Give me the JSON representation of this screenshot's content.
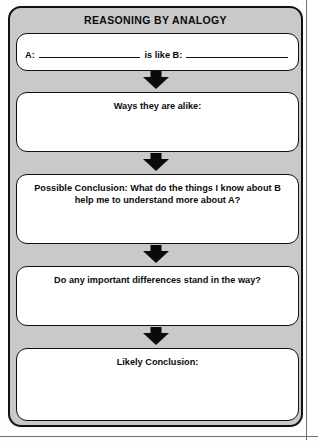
{
  "worksheet": {
    "title": "REASONING BY ANALOGY",
    "analogy_prompt": {
      "label_a": "A:",
      "label_b": "is like B:",
      "value_a": "",
      "value_b": ""
    },
    "steps": [
      {
        "name": "ways-alike",
        "label": "Ways they are alike:",
        "value": ""
      },
      {
        "name": "possible-conclusion",
        "label": "Possible Conclusion: What do the things I know about B help me to understand more about A?",
        "value": ""
      },
      {
        "name": "important-differences",
        "label": "Do any important differences stand in the way?",
        "value": ""
      },
      {
        "name": "likely-conclusion",
        "label": "Likely Conclusion:",
        "value": ""
      }
    ],
    "connectors": [
      {
        "name": "arrow-analogy-to-alike",
        "icon": "arrow-down-icon"
      },
      {
        "name": "arrow-alike-to-possible",
        "icon": "arrow-down-icon"
      },
      {
        "name": "arrow-possible-to-differences",
        "icon": "arrow-down-icon"
      },
      {
        "name": "arrow-differences-to-likely",
        "icon": "arrow-down-icon"
      }
    ],
    "colors": {
      "panel_background": "#c9c9c9",
      "box_background": "#ffffff",
      "border": "#111111",
      "text": "#0b0b0b",
      "arrow": "#0a0a0a",
      "page_background": "#fdfdfd",
      "margin_rule": "#6e6e6e"
    }
  }
}
